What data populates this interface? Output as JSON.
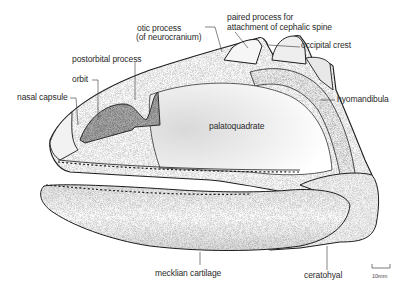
{
  "figure": {
    "labels": {
      "otic_process_line1": "otic process",
      "otic_process_line2": "(of neurocranium)",
      "paired_process_line1": "paired process for",
      "paired_process_line2": "attachment of cephalic spine",
      "occipital_crest": "occipital crest",
      "postorbital_process": "postorbital process",
      "orbit": "orbit",
      "nasal_capsule": "nasal capsule",
      "hyomandibula": "hyomandibula",
      "palatoquadrate": "palatoquadrate",
      "mecklian_cartilage": "mecklian cartilage",
      "ceratohyal": "ceratohyal"
    },
    "scale_bar": {
      "label": "10mm"
    },
    "colors": {
      "line": "#1e1e1e",
      "stipple": "#8a8a8a",
      "orbit_shade": "#9a9a9a",
      "background": "#ffffff"
    }
  }
}
